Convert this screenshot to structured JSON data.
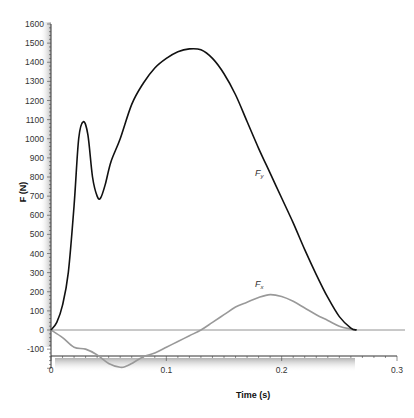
{
  "chart_data": {
    "type": "line",
    "title": "",
    "xlabel": "Time (s)",
    "ylabel": "F (N)",
    "xlim": [
      0,
      0.3
    ],
    "ylim": [
      -200,
      1600
    ],
    "x_ticks": [
      "0",
      "0.1",
      "0.2",
      "0.3"
    ],
    "y_ticks": [
      "-100",
      "0",
      "100",
      "200",
      "300",
      "400",
      "500",
      "600",
      "700",
      "800",
      "900",
      "1000",
      "1100",
      "1200",
      "1300",
      "1400",
      "1500",
      "1600"
    ],
    "grid": false,
    "legend": "inline labels",
    "series": [
      {
        "name": "Fy",
        "label_main": "F",
        "label_sub": "y",
        "color": "#111111",
        "x": [
          0,
          0.005,
          0.01,
          0.015,
          0.02,
          0.024,
          0.028,
          0.032,
          0.036,
          0.04,
          0.043,
          0.047,
          0.052,
          0.06,
          0.07,
          0.08,
          0.09,
          0.1,
          0.11,
          0.12,
          0.13,
          0.14,
          0.15,
          0.16,
          0.17,
          0.18,
          0.19,
          0.2,
          0.21,
          0.22,
          0.23,
          0.24,
          0.25,
          0.26,
          0.265
        ],
        "values": [
          0,
          40,
          130,
          300,
          650,
          1000,
          1089,
          1020,
          800,
          700,
          690,
          760,
          880,
          1000,
          1180,
          1290,
          1370,
          1420,
          1455,
          1470,
          1465,
          1420,
          1340,
          1230,
          1090,
          950,
          820,
          690,
          560,
          420,
          290,
          170,
          70,
          10,
          0
        ]
      },
      {
        "name": "Fx",
        "label_main": "F",
        "label_sub": "x",
        "color": "#999999",
        "x": [
          0,
          0.01,
          0.02,
          0.03,
          0.04,
          0.05,
          0.06,
          0.065,
          0.07,
          0.08,
          0.09,
          0.1,
          0.11,
          0.12,
          0.13,
          0.14,
          0.15,
          0.16,
          0.17,
          0.18,
          0.19,
          0.2,
          0.21,
          0.22,
          0.23,
          0.24,
          0.25,
          0.26,
          0.265
        ],
        "values": [
          0,
          -40,
          -90,
          -100,
          -130,
          -175,
          -195,
          -190,
          -175,
          -140,
          -120,
          -90,
          -60,
          -30,
          0,
          40,
          80,
          120,
          145,
          170,
          185,
          175,
          150,
          115,
          80,
          50,
          20,
          5,
          0
        ]
      }
    ],
    "reference_line": {
      "y": 0,
      "color": "#777777"
    }
  }
}
